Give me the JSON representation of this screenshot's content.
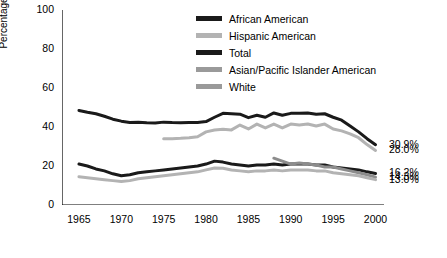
{
  "chart_data": {
    "type": "line",
    "title": "",
    "xlabel": "",
    "ylabel": "Percentage",
    "xlim": [
      1963,
      2001
    ],
    "ylim": [
      0,
      100
    ],
    "yticks": [
      0,
      20,
      40,
      60,
      80,
      100
    ],
    "xticks": [
      1965,
      1970,
      1975,
      1980,
      1985,
      1990,
      1995,
      2000
    ],
    "grid": false,
    "legend_position": "top-right",
    "series": [
      {
        "name": "African American",
        "color": "#1a1a1a",
        "end_label": "30.9%",
        "x": [
          1965,
          1966,
          1967,
          1968,
          1969,
          1970,
          1971,
          1972,
          1973,
          1974,
          1975,
          1976,
          1977,
          1978,
          1979,
          1980,
          1981,
          1982,
          1983,
          1984,
          1985,
          1986,
          1987,
          1988,
          1989,
          1990,
          1991,
          1992,
          1993,
          1994,
          1995,
          1996,
          1997,
          1998,
          1999,
          2000
        ],
        "y": [
          48.5,
          47.6,
          46.8,
          45.5,
          44.0,
          43.0,
          42.3,
          42.4,
          42.2,
          42.1,
          42.5,
          42.3,
          42.2,
          42.3,
          42.3,
          42.8,
          45.0,
          47.0,
          46.8,
          46.6,
          44.8,
          46.0,
          45.0,
          47.2,
          46.0,
          47.0,
          47.0,
          47.2,
          46.5,
          46.8,
          45.0,
          43.5,
          40.5,
          37.5,
          34.0,
          30.9
        ]
      },
      {
        "name": "Hispanic American",
        "color": "#b3b3b3",
        "end_label": "28.0%",
        "x": [
          1975,
          1976,
          1977,
          1978,
          1979,
          1980,
          1981,
          1982,
          1983,
          1984,
          1985,
          1986,
          1987,
          1988,
          1989,
          1990,
          1991,
          1992,
          1993,
          1994,
          1995,
          1996,
          1997,
          1998,
          1999,
          2000
        ],
        "y": [
          34.0,
          34.0,
          34.2,
          34.5,
          35.0,
          37.5,
          38.5,
          38.8,
          38.5,
          41.0,
          39.0,
          41.5,
          39.5,
          41.5,
          39.5,
          41.5,
          41.0,
          41.5,
          40.5,
          41.5,
          39.0,
          38.0,
          36.5,
          34.5,
          31.0,
          28.0
        ]
      },
      {
        "name": "Total",
        "color": "#1a1a1a",
        "end_label": "16.2%",
        "x": [
          1965,
          1966,
          1967,
          1968,
          1969,
          1970,
          1971,
          1972,
          1973,
          1974,
          1975,
          1976,
          1977,
          1978,
          1979,
          1980,
          1981,
          1982,
          1983,
          1984,
          1985,
          1986,
          1987,
          1988,
          1989,
          1990,
          1991,
          1992,
          1993,
          1994,
          1995,
          1996,
          1997,
          1998,
          1999,
          2000
        ],
        "y": [
          21.0,
          20.0,
          18.5,
          17.5,
          16.0,
          15.0,
          15.5,
          16.5,
          17.0,
          17.5,
          18.0,
          18.5,
          19.0,
          19.5,
          20.0,
          21.0,
          22.5,
          22.0,
          21.0,
          20.5,
          20.0,
          20.5,
          20.5,
          21.0,
          20.5,
          21.0,
          21.0,
          21.0,
          20.5,
          20.5,
          19.5,
          19.0,
          18.5,
          18.0,
          17.0,
          16.2
        ]
      },
      {
        "name": "Asian/Pacific Islander American",
        "color": "#8c8c8c",
        "end_label": "14.3%",
        "x": [
          1988,
          1989,
          1990,
          1991,
          1992,
          1993,
          1994,
          1995,
          1996,
          1997,
          1998,
          1999,
          2000
        ],
        "y": [
          24.0,
          22.5,
          21.0,
          21.5,
          21.0,
          20.5,
          19.5,
          19.5,
          18.5,
          17.5,
          16.5,
          15.5,
          14.3
        ]
      },
      {
        "name": "White",
        "color": "#b3b3b3",
        "end_label": "13.0%",
        "x": [
          1965,
          1966,
          1967,
          1968,
          1969,
          1970,
          1971,
          1972,
          1973,
          1974,
          1975,
          1976,
          1977,
          1978,
          1979,
          1980,
          1981,
          1982,
          1983,
          1984,
          1985,
          1986,
          1987,
          1988,
          1989,
          1990,
          1991,
          1992,
          1993,
          1994,
          1995,
          1996,
          1997,
          1998,
          1999,
          2000
        ],
        "y": [
          14.5,
          14.0,
          13.5,
          13.0,
          12.5,
          12.0,
          12.5,
          13.5,
          14.0,
          14.5,
          15.0,
          15.5,
          16.0,
          16.5,
          17.0,
          18.0,
          19.0,
          18.8,
          18.0,
          17.5,
          17.0,
          17.5,
          17.5,
          18.0,
          17.5,
          18.0,
          18.0,
          18.0,
          17.5,
          17.5,
          16.5,
          16.0,
          15.5,
          15.0,
          14.0,
          13.0
        ]
      }
    ]
  },
  "axes": {
    "ylabel": "Percentage",
    "yticks": [
      "0",
      "20",
      "40",
      "60",
      "80",
      "100"
    ],
    "xticks": [
      "1965",
      "1970",
      "1975",
      "1980",
      "1985",
      "1990",
      "1995",
      "2000"
    ]
  },
  "legend": {
    "items": [
      {
        "label": "African American",
        "color": "#1a1a1a"
      },
      {
        "label": "Hispanic American",
        "color": "#b3b3b3"
      },
      {
        "label": "Total",
        "color": "#1a1a1a"
      },
      {
        "label": "Asian/Pacific Islander American",
        "color": "#8c8c8c"
      },
      {
        "label": "White",
        "color": "#8c8c8c"
      }
    ]
  },
  "end_labels": [
    {
      "text": "30.9%",
      "series": "African American"
    },
    {
      "text": "28.0%",
      "series": "Hispanic American"
    },
    {
      "text": "16.2%",
      "series": "Total"
    },
    {
      "text": "14.3%",
      "series": "Asian/Pacific Islander American"
    },
    {
      "text": "13.0%",
      "series": "White"
    }
  ]
}
